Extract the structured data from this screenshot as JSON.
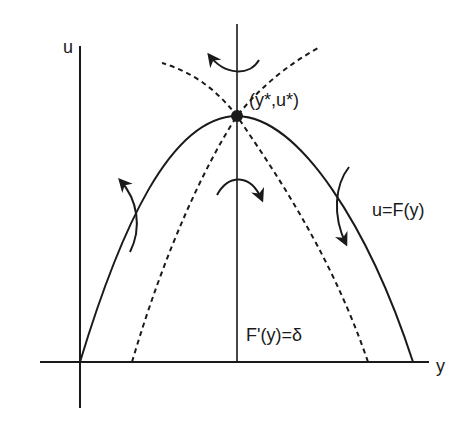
{
  "diagram": {
    "type": "phase-diagram",
    "axes": {
      "vertical_label": "u",
      "horizontal_label": "y"
    },
    "labels": {
      "equilibrium": "(y*,u*)",
      "curve": "u=F(y)",
      "vertical_line": "F'(y)=δ"
    },
    "elements": [
      {
        "name": "solid-curve",
        "description": "concave parabola u=F(y) from origin through equilibrium to y-axis"
      },
      {
        "name": "vertical-line",
        "description": "F'(y)=δ through equilibrium"
      },
      {
        "name": "dashed-separatrix-1",
        "description": "dashed saddle path through equilibrium"
      },
      {
        "name": "dashed-separatrix-2",
        "description": "dashed saddle path through equilibrium"
      },
      {
        "name": "equilibrium-point",
        "description": "filled dot at (y*,u*)"
      },
      {
        "name": "flow-arrows",
        "count": 4
      }
    ],
    "colors": {
      "stroke": "#1a1a1a",
      "background": "#ffffff"
    }
  }
}
